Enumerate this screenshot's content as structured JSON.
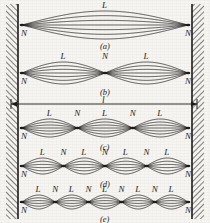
{
  "figure": {
    "background_color": "#f7f5f1",
    "ink_color": "#1a1a1a",
    "width": 210,
    "height": 223,
    "length_label": "l",
    "node_label": "N",
    "loop_label": "L",
    "string_span": {
      "x_left": 22,
      "x_right": 188
    },
    "dimension_line": {
      "y": 104,
      "x_left": 11,
      "x_right": 197,
      "label": "l"
    },
    "panels": [
      {
        "id": "a",
        "caption": "(a)",
        "caption_x": 100,
        "caption_y": 42,
        "loops": 1,
        "center_y": 25,
        "amplitude": 14,
        "strands": 7,
        "node_labels": [
          "N",
          "N"
        ],
        "loop_labels": [
          "L"
        ]
      },
      {
        "id": "b",
        "caption": "(b)",
        "caption_x": 100,
        "caption_y": 88,
        "loops": 2,
        "center_y": 73,
        "amplitude": 11,
        "strands": 7,
        "node_labels": [
          "N",
          "N",
          "N"
        ],
        "loop_labels": [
          "L",
          "L"
        ]
      },
      {
        "id": "c",
        "caption": "(c)",
        "caption_x": 100,
        "caption_y": 143,
        "loops": 3,
        "center_y": 128,
        "amplitude": 9,
        "strands": 7,
        "node_labels": [
          "N",
          "N",
          "N",
          "N"
        ],
        "loop_labels": [
          "L",
          "L",
          "L"
        ]
      },
      {
        "id": "d",
        "caption": "(d)",
        "caption_x": 100,
        "caption_y": 180,
        "loops": 4,
        "center_y": 166,
        "amplitude": 8,
        "strands": 6,
        "node_labels": [
          "N",
          "N",
          "N",
          "N",
          "N"
        ],
        "loop_labels": [
          "L",
          "L",
          "L",
          "L"
        ]
      },
      {
        "id": "e",
        "caption": "(e)",
        "caption_x": 100,
        "caption_y": 215,
        "loops": 5,
        "center_y": 202,
        "amplitude": 7,
        "strands": 6,
        "node_labels": [
          "N",
          "N",
          "N",
          "N",
          "N",
          "N"
        ],
        "loop_labels": [
          "L",
          "L",
          "L",
          "L",
          "L"
        ]
      }
    ],
    "walls": [
      {
        "side": "left",
        "x": 6,
        "width": 12
      },
      {
        "side": "right",
        "x": 192,
        "width": 12
      }
    ]
  }
}
